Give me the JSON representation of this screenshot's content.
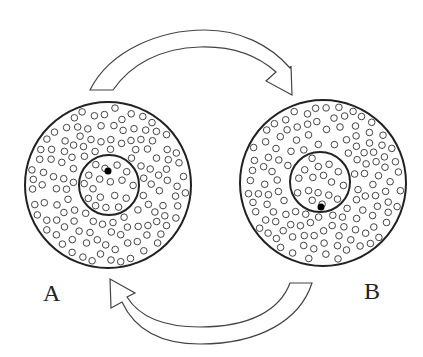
{
  "diagram": {
    "type": "two-state exchange cycle",
    "states": [
      {
        "label": "A",
        "marked_particle_position": "inner-core-upper"
      },
      {
        "label": "B",
        "marked_particle_position": "inner-core-lower"
      }
    ],
    "arrows": [
      {
        "from": "A",
        "to": "B",
        "position": "top"
      },
      {
        "from": "B",
        "to": "A",
        "position": "bottom"
      }
    ],
    "colors": {
      "stroke": "#333333",
      "fill": "#ffffff",
      "marked": "#000000"
    }
  },
  "labels": {
    "a": "A",
    "b": "B"
  }
}
